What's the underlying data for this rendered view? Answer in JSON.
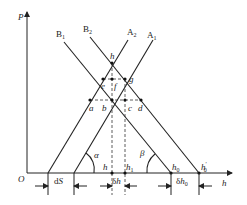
{
  "diagram": {
    "axes": {
      "y_label": "P",
      "x_label": "h",
      "origin_label": "O"
    },
    "lines": [
      {
        "id": "B1",
        "label": "B1",
        "label_main": "B",
        "label_sub": "1"
      },
      {
        "id": "B2",
        "label": "B2",
        "label_main": "B",
        "label_sub": "2"
      },
      {
        "id": "A2",
        "label": "A2",
        "label_main": "A",
        "label_sub": "2"
      },
      {
        "id": "A1",
        "label": "A1",
        "label_main": "A",
        "label_sub": "1"
      }
    ],
    "points": {
      "top": "h",
      "g": "g",
      "e": "e",
      "f": "f",
      "a": "a",
      "b": "b",
      "c": "c",
      "d": "d"
    },
    "baseline_labels": {
      "h": "h",
      "h1_main": "h",
      "h1_sub": "1",
      "h0_main": "h",
      "h0_sub": "0",
      "h0p_main": "h",
      "h0p_sub": "0",
      "h0p_prime": "′"
    },
    "angles": {
      "alpha": "α",
      "beta": "β"
    },
    "dimensions": {
      "dS_d": "d",
      "dS_S": "S",
      "dh_delta": "δ",
      "dh_h": "h",
      "dh0_delta": "δ",
      "dh0_h": "h",
      "dh0_sub": "0"
    }
  }
}
